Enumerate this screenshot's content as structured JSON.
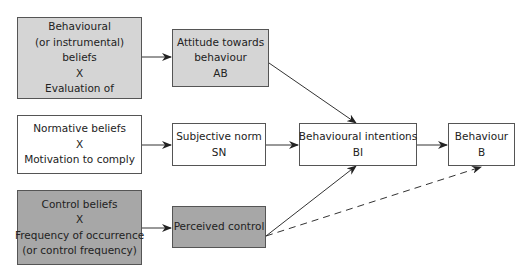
{
  "diagram": {
    "colors": {
      "light_fill": "#d5d5d5",
      "dark_fill": "#a7a7a7",
      "white_fill": "#ffffff",
      "stroke": "#333333"
    },
    "nodes": {
      "behavioural_beliefs": {
        "lines": [
          "Behavioural",
          "(or instrumental)",
          "beliefs",
          "X",
          "Evaluation of"
        ]
      },
      "attitude": {
        "lines": [
          "Attitude towards",
          "behaviour",
          "AB"
        ]
      },
      "normative_beliefs": {
        "lines": [
          "Normative beliefs",
          "X",
          "Motivation to comply"
        ]
      },
      "subjective_norm": {
        "lines": [
          "Subjective norm",
          "SN"
        ]
      },
      "control_beliefs": {
        "lines": [
          "Control beliefs",
          "X",
          "Frequency of occurrence",
          "(or control frequency)"
        ]
      },
      "perceived_control": {
        "lines": [
          "Perceived control"
        ]
      },
      "behavioural_intentions": {
        "lines": [
          "Behavioural intentions",
          "BI"
        ]
      },
      "behaviour": {
        "lines": [
          "Behaviour",
          "B"
        ]
      }
    },
    "edges": [
      {
        "from": "behavioural_beliefs",
        "to": "attitude",
        "style": "solid"
      },
      {
        "from": "normative_beliefs",
        "to": "subjective_norm",
        "style": "solid"
      },
      {
        "from": "control_beliefs",
        "to": "perceived_control",
        "style": "solid"
      },
      {
        "from": "attitude",
        "to": "behavioural_intentions",
        "style": "solid"
      },
      {
        "from": "subjective_norm",
        "to": "behavioural_intentions",
        "style": "solid"
      },
      {
        "from": "perceived_control",
        "to": "behavioural_intentions",
        "style": "solid"
      },
      {
        "from": "behavioural_intentions",
        "to": "behaviour",
        "style": "solid"
      },
      {
        "from": "perceived_control",
        "to": "behaviour",
        "style": "dashed"
      }
    ]
  }
}
